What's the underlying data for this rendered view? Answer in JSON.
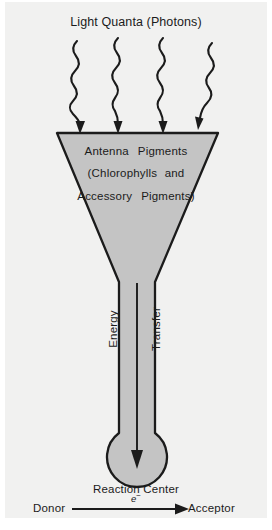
{
  "figure": {
    "title": "Light Quanta (Photons)",
    "background_color": "#f1f1f0",
    "funnel_fill_color": "#c4c4c4",
    "stroke_color": "#1b1b1b"
  },
  "antenna": {
    "line1_word1": "Antenna",
    "line1_word2": "Pigments",
    "line2_word1": "(Chlorophylls",
    "line2_word2": "and",
    "line3_word1": "Accessory",
    "line3_word2": "Pigments)"
  },
  "energy_arrow": {
    "label_top": "Energy",
    "label_bottom": "Transfer"
  },
  "reaction_center": {
    "label": "Reaction Center"
  },
  "electron_transfer": {
    "donor": "Donor",
    "acceptor": "Acceptor",
    "electron_symbol": "e",
    "electron_charge": "−"
  },
  "photons": {
    "count": 4,
    "icon": "wavy-arrow-icon"
  }
}
